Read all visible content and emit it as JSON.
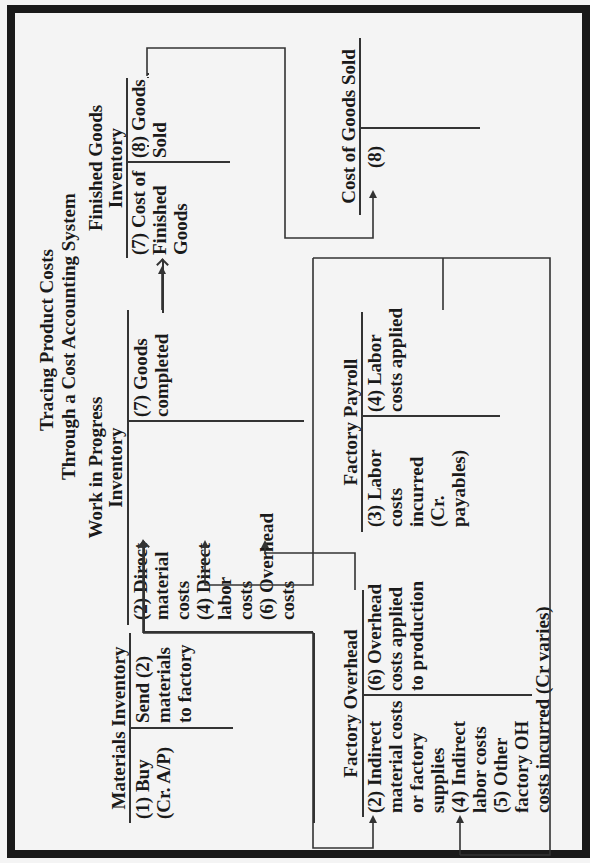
{
  "title": {
    "line1": "Tracing Product Costs",
    "line2": "Through a Cost Accounting System"
  },
  "accounts": {
    "materials_inventory": {
      "name": "Materials Inventory",
      "debit": [
        "(1) Buy",
        "(Cr. A/P)"
      ],
      "credit": [
        "Send (2)",
        "materials",
        "to factory"
      ]
    },
    "work_in_progress": {
      "name_line1": "Work in Progress",
      "name_line2": "Inventory",
      "debit": [
        "(2) Direct",
        "material",
        "costs",
        "(4) Direct",
        "labor",
        "costs",
        "(6) Overhead",
        "costs"
      ],
      "credit": [
        "(7) Goods",
        "completed"
      ]
    },
    "finished_goods": {
      "name_line1": "Finished Goods",
      "name_line2": "Inventory",
      "debit": [
        "(7) Cost of",
        "Finished",
        "Goods"
      ],
      "credit": [
        "(8) Goods",
        "Sold"
      ]
    },
    "cost_of_goods_sold": {
      "name": "Cost of Goods Sold",
      "debit": [
        "(8)"
      ],
      "credit": []
    },
    "factory_overhead": {
      "name": "Factory Overhead",
      "debit": [
        "(2) Indirect",
        "material costs",
        "or factory",
        "supplies",
        "(4) Indirect",
        "labor costs",
        "(5) Other",
        "factory OH",
        "costs incurred (Cr varies)"
      ],
      "credit": [
        "(6) Overhead",
        "costs applied",
        "to production"
      ]
    },
    "factory_payroll": {
      "name": "Factory Payroll",
      "debit": [
        "(3) Labor",
        "costs",
        "incurred",
        "(Cr.",
        "payables)"
      ],
      "credit": [
        "(4) Labor",
        "costs applied"
      ]
    }
  },
  "colors": {
    "background": "#f4f4f4",
    "ink": "#1a1a1a",
    "lines": "#333333"
  }
}
